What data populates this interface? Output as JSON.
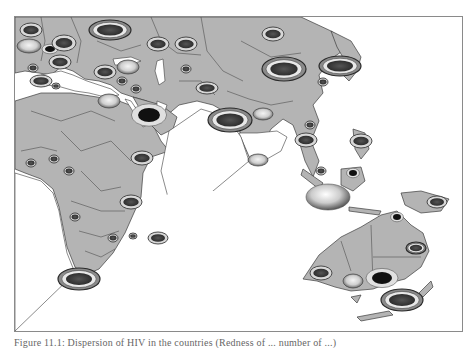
{
  "figure": {
    "type": "choropleth-bubble-map",
    "region_shown": "Europe, Africa, Middle East, South & East Asia, Southeast Asia, Australia, New Zealand",
    "caption": "Figure 11.1: Dispersion of HIV in the countries (Redness of ... number of ...)",
    "colors": {
      "land": "#b4b4b4",
      "border": "#3c3c3c",
      "water": "#ffffff",
      "frame": "#8a8a8a",
      "marker_dark": "#3a3a3a",
      "marker_mid": "#7a7a7a",
      "marker_light": "#e6e6e6"
    }
  },
  "markers": [
    {
      "id": "m1",
      "label": "uk",
      "x": 30,
      "y": 29,
      "rx": 11,
      "ry": 7,
      "style": "ring-dark"
    },
    {
      "id": "m2",
      "label": "france",
      "x": 28,
      "y": 45,
      "rx": 12,
      "ry": 7,
      "style": "light"
    },
    {
      "id": "m3",
      "label": "belgium",
      "x": 49,
      "y": 48,
      "rx": 5,
      "ry": 3,
      "style": "dot"
    },
    {
      "id": "m4",
      "label": "germany",
      "x": 63,
      "y": 42,
      "rx": 12,
      "ry": 8,
      "style": "ring-dark"
    },
    {
      "id": "m5",
      "label": "spain",
      "x": 32,
      "y": 67,
      "rx": 5,
      "ry": 4,
      "style": "ring-dark"
    },
    {
      "id": "m6",
      "label": "italy",
      "x": 59,
      "y": 61,
      "rx": 11,
      "ry": 7,
      "style": "ring-dark"
    },
    {
      "id": "m7",
      "label": "russia-west",
      "x": 109,
      "y": 29,
      "rx": 21,
      "ry": 10,
      "style": "ring-big"
    },
    {
      "id": "m8",
      "label": "ukraine",
      "x": 157,
      "y": 43,
      "rx": 11,
      "ry": 7,
      "style": "ring-dark"
    },
    {
      "id": "m9",
      "label": "turkey",
      "x": 127,
      "y": 66,
      "rx": 11,
      "ry": 7,
      "style": "light"
    },
    {
      "id": "m10",
      "label": "greece",
      "x": 104,
      "y": 71,
      "rx": 11,
      "ry": 7,
      "style": "ring-dark"
    },
    {
      "id": "m11",
      "label": "morocco",
      "x": 40,
      "y": 80,
      "rx": 11,
      "ry": 6,
      "style": "ring-dark"
    },
    {
      "id": "m12",
      "label": "tunisia",
      "x": 55,
      "y": 85,
      "rx": 4,
      "ry": 3,
      "style": "ring-dark"
    },
    {
      "id": "m13",
      "label": "syria",
      "x": 121,
      "y": 80,
      "rx": 5,
      "ry": 4,
      "style": "ring-dark"
    },
    {
      "id": "m14",
      "label": "iraq",
      "x": 135,
      "y": 88,
      "rx": 5,
      "ry": 4,
      "style": "ring-dark"
    },
    {
      "id": "m15",
      "label": "egypt",
      "x": 108,
      "y": 100,
      "rx": 11,
      "ry": 7,
      "style": "light"
    },
    {
      "id": "m16",
      "label": "saudi",
      "x": 148,
      "y": 114,
      "rx": 11,
      "ry": 7,
      "style": "dot"
    },
    {
      "id": "m17",
      "label": "kazakhstan",
      "x": 185,
      "y": 43,
      "rx": 11,
      "ry": 7,
      "style": "ring-dark"
    },
    {
      "id": "m18",
      "label": "russia-east",
      "x": 272,
      "y": 33,
      "rx": 11,
      "ry": 7,
      "style": "ring-dark"
    },
    {
      "id": "m19",
      "label": "uzbekistan",
      "x": 185,
      "y": 68,
      "rx": 5,
      "ry": 4,
      "style": "ring-dark"
    },
    {
      "id": "m20",
      "label": "afghanistan",
      "x": 206,
      "y": 87,
      "rx": 11,
      "ry": 6,
      "style": "ring-dark"
    },
    {
      "id": "m21",
      "label": "china",
      "x": 283,
      "y": 68,
      "rx": 22,
      "ry": 12,
      "style": "ring-big"
    },
    {
      "id": "m22",
      "label": "india",
      "x": 229,
      "y": 119,
      "rx": 22,
      "ry": 12,
      "style": "ring-big"
    },
    {
      "id": "m23",
      "label": "bangladesh",
      "x": 262,
      "y": 113,
      "rx": 10,
      "ry": 6,
      "style": "light"
    },
    {
      "id": "m24",
      "label": "sri-lanka",
      "x": 257,
      "y": 159,
      "rx": 10,
      "ry": 6,
      "style": "light"
    },
    {
      "id": "m25",
      "label": "japan",
      "x": 339,
      "y": 65,
      "rx": 21,
      "ry": 10,
      "style": "ring-big"
    },
    {
      "id": "m26",
      "label": "korea",
      "x": 322,
      "y": 81,
      "rx": 5,
      "ry": 4,
      "style": "ring-dark"
    },
    {
      "id": "m27",
      "label": "thailand",
      "x": 305,
      "y": 139,
      "rx": 11,
      "ry": 7,
      "style": "ring-dark"
    },
    {
      "id": "m28",
      "label": "vietnam",
      "x": 309,
      "y": 124,
      "rx": 5,
      "ry": 4,
      "style": "ring-dark"
    },
    {
      "id": "m29",
      "label": "philippines",
      "x": 360,
      "y": 140,
      "rx": 11,
      "ry": 7,
      "style": "ring-dark"
    },
    {
      "id": "m30",
      "label": "malaysia",
      "x": 320,
      "y": 170,
      "rx": 5,
      "ry": 4,
      "style": "ring-dark"
    },
    {
      "id": "m31",
      "label": "indonesia",
      "x": 327,
      "y": 196,
      "rx": 22,
      "ry": 13,
      "style": "sphere"
    },
    {
      "id": "m32",
      "label": "borneo",
      "x": 352,
      "y": 172,
      "rx": 4,
      "ry": 3,
      "style": "dot"
    },
    {
      "id": "m33",
      "label": "png",
      "x": 436,
      "y": 201,
      "rx": 10,
      "ry": 6,
      "style": "ring-dark"
    },
    {
      "id": "m34",
      "label": "senegal",
      "x": 30,
      "y": 162,
      "rx": 5,
      "ry": 4,
      "style": "ring-dark"
    },
    {
      "id": "m35",
      "label": "nigeria",
      "x": 53,
      "y": 158,
      "rx": 5,
      "ry": 4,
      "style": "ring-dark"
    },
    {
      "id": "m36",
      "label": "cameroon",
      "x": 68,
      "y": 170,
      "rx": 5,
      "ry": 4,
      "style": "ring-dark"
    },
    {
      "id": "m37",
      "label": "ethiopia",
      "x": 141,
      "y": 157,
      "rx": 11,
      "ry": 7,
      "style": "ring-dark"
    },
    {
      "id": "m38",
      "label": "kenya",
      "x": 130,
      "y": 201,
      "rx": 11,
      "ry": 7,
      "style": "ring-dark"
    },
    {
      "id": "m39",
      "label": "angola",
      "x": 74,
      "y": 216,
      "rx": 5,
      "ry": 4,
      "style": "ring-dark"
    },
    {
      "id": "m40",
      "label": "zambia",
      "x": 112,
      "y": 237,
      "rx": 5,
      "ry": 4,
      "style": "ring-dark"
    },
    {
      "id": "m41",
      "label": "mozambique",
      "x": 132,
      "y": 235,
      "rx": 4,
      "ry": 3,
      "style": "ring-dark"
    },
    {
      "id": "m42",
      "label": "madagascar",
      "x": 157,
      "y": 237,
      "rx": 10,
      "ry": 6,
      "style": "ring-dark"
    },
    {
      "id": "m43",
      "label": "south-africa",
      "x": 78,
      "y": 278,
      "rx": 21,
      "ry": 11,
      "style": "ring-big"
    },
    {
      "id": "m44",
      "label": "australia-north",
      "x": 396,
      "y": 216,
      "rx": 4,
      "ry": 3,
      "style": "dot"
    },
    {
      "id": "m45",
      "label": "queensland",
      "x": 415,
      "y": 247,
      "rx": 10,
      "ry": 6,
      "style": "ring-big"
    },
    {
      "id": "m46",
      "label": "western-australia",
      "x": 320,
      "y": 272,
      "rx": 11,
      "ry": 7,
      "style": "ring-dark"
    },
    {
      "id": "m47",
      "label": "south-australia",
      "x": 352,
      "y": 280,
      "rx": 10,
      "ry": 7,
      "style": "light"
    },
    {
      "id": "m48",
      "label": "victoria",
      "x": 381,
      "y": 277,
      "rx": 10,
      "ry": 6,
      "style": "dot"
    },
    {
      "id": "m49",
      "label": "new-zealand",
      "x": 401,
      "y": 299,
      "rx": 21,
      "ry": 11,
      "style": "ring-big"
    }
  ]
}
